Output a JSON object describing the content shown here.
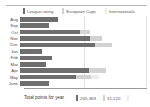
{
  "chart_data": {
    "type": "bar",
    "orientation": "horizontal",
    "stacked": true,
    "title": "",
    "xlabel": "",
    "ylabel": "",
    "grid": true,
    "legend_position": "top",
    "categories": [
      "Aug",
      "Sep",
      "Oct",
      "Nov",
      "Dec",
      "Jan",
      "Feb",
      "Mar",
      "Apr",
      "May",
      "June"
    ],
    "series": [
      {
        "name": "League rating",
        "color": "#6e6e6e",
        "values": [
          29500,
          22000,
          46000,
          54000,
          58000,
          17000,
          24500,
          20000,
          53000,
          43000,
          22500
        ]
      },
      {
        "name": "European Cups",
        "color": "#d2d2d2",
        "values": [
          0,
          0,
          7500,
          9000,
          12500,
          0,
          0,
          0,
          13000,
          11500,
          0
        ]
      },
      {
        "name": "Internationals",
        "color": "#ededed",
        "values": [
          0,
          0,
          0,
          0,
          0,
          0,
          0,
          0,
          0,
          6000,
          0
        ]
      }
    ],
    "xlim": [
      0,
      100000
    ],
    "totals": {
      "label": "Total points for year",
      "items": [
        {
          "series": "League rating",
          "value": "265,369",
          "color": "#6e6e6e"
        },
        {
          "series": "European Cups",
          "value": "51,120",
          "color": "#d2d2d2"
        },
        {
          "series": "Internationals",
          "value": "",
          "color": "#ededed"
        }
      ]
    }
  },
  "legend": {
    "items": [
      {
        "label": "League rating",
        "color": "#6e6e6e"
      },
      {
        "label": "European Cups",
        "color": "#d2d2d2"
      },
      {
        "label": "Internationals",
        "color": "#ededed"
      }
    ]
  },
  "rows": [
    {
      "label": "Aug"
    },
    {
      "label": "Sep"
    },
    {
      "label": "Oct"
    },
    {
      "label": "Nov"
    },
    {
      "label": "Dec"
    },
    {
      "label": "Jan"
    },
    {
      "label": "Feb"
    },
    {
      "label": "Mar"
    },
    {
      "label": "Apr"
    },
    {
      "label": "May"
    },
    {
      "label": "June"
    }
  ]
}
